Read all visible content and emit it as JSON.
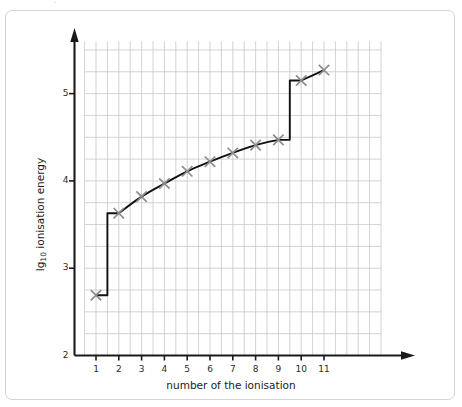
{
  "figure": {
    "background_color": "#ffffff",
    "frame_color": "#d4d4d4",
    "speck": "·"
  },
  "chart_data": {
    "type": "line",
    "title": "",
    "xlabel": "number of the ionisation",
    "ylabel_text": "lg",
    "ylabel_sub": "10",
    "ylabel_rest": " ionisation energy",
    "ylabel_full": "lg10 ionisation energy",
    "x": [
      1,
      2,
      3,
      4,
      5,
      6,
      7,
      8,
      9,
      10,
      11
    ],
    "values": [
      2.69,
      3.63,
      3.82,
      3.97,
      4.11,
      4.22,
      4.32,
      4.41,
      4.47,
      5.15,
      5.27
    ],
    "series": [
      {
        "name": "lg10 ionisation energy",
        "values": [
          2.69,
          3.63,
          3.82,
          3.97,
          4.11,
          4.22,
          4.32,
          4.41,
          4.47,
          5.15,
          5.27
        ]
      }
    ],
    "xlim": [
      0.5,
      13.5
    ],
    "ylim": [
      2,
      5.6
    ],
    "xticks": [
      1,
      2,
      3,
      4,
      5,
      6,
      7,
      8,
      9,
      10,
      11
    ],
    "xtick_labels": [
      "1",
      "2",
      "3",
      "4",
      "5",
      "6",
      "7",
      "8",
      "9",
      "10",
      "11"
    ],
    "yticks": [
      2,
      3,
      4,
      5
    ],
    "ytick_labels": [
      "2",
      "3",
      "4",
      "5"
    ],
    "grid": true,
    "grid_color": "#c8c8c8",
    "grid_x_step": 0.5,
    "grid_y_step": 0.25,
    "legend": "none",
    "marker": "x",
    "marker_color": "#8c8c8c",
    "line_color": "#111111",
    "axis_color": "#1a1a1a",
    "annotations": [
      {
        "text": "large jump between ionisation 1 and 2"
      },
      {
        "text": "large jump between ionisation 9 and 10"
      }
    ]
  }
}
